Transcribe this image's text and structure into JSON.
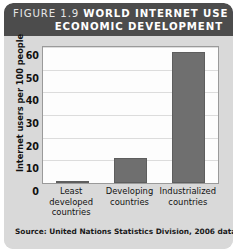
{
  "figure": {
    "number_label": "FIGURE 1.9",
    "title": "WORLD INTERNET USE BY",
    "title_line2": "ECONOMIC DEVELOPMENT",
    "source": "Source: United Nations Statistics Division, 2006 data",
    "header_bg": "#4c4c4c",
    "card_bg": "#d9d9d9",
    "bar_color": "#6f6f6f",
    "plot_bg": "#fdfdfd",
    "grid_color": "#dcdcdc"
  },
  "chart_data": {
    "type": "bar",
    "title": "FIGURE 1.9 WORLD INTERNET USE BY ECONOMIC DEVELOPMENT",
    "categories": [
      "Least developed countries",
      "Developing countries",
      "Industrialized countries"
    ],
    "category_lines": [
      [
        "Least",
        "developed",
        "countries"
      ],
      [
        "Developing",
        "countries"
      ],
      [
        "Industrialized",
        "countries"
      ]
    ],
    "values": [
      1,
      11,
      58
    ],
    "xlabel": "",
    "ylabel": "Internet users per 100 people",
    "ylim": [
      0,
      60
    ],
    "yticks": [
      0,
      10,
      20,
      30,
      40,
      50,
      60
    ],
    "grid": true,
    "legend": false,
    "source": "Source: United Nations Statistics Division, 2006 data"
  }
}
